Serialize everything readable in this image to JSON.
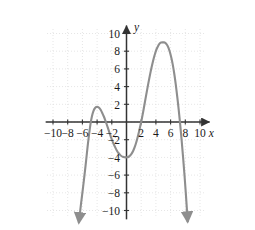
{
  "chart_data": {
    "type": "line",
    "title": "",
    "subtitle": "",
    "xlabel": "x",
    "ylabel": "y",
    "xlim": [
      -11.2,
      11.2
    ],
    "ylim": [
      -11.0,
      10.8
    ],
    "grid": true,
    "grid_style": "dotted",
    "grid_step": 2,
    "legend": "none",
    "axis_arrows": {
      "x_positive": true,
      "y_positive": true
    },
    "xticks": [
      -10,
      -8,
      -6,
      -4,
      -2,
      2,
      4,
      6,
      8,
      10
    ],
    "xtick_labels": [
      "−10",
      "−8",
      "−6",
      "−4",
      "−2",
      "2",
      "4",
      "6",
      "8",
      "10"
    ],
    "yticks": [
      10,
      8,
      6,
      4,
      2,
      -2,
      -4,
      -6,
      -8,
      -10
    ],
    "ytick_labels": [
      "10",
      "8",
      "6",
      "4",
      "2",
      "−2",
      "−4",
      "−6",
      "−8",
      "−10"
    ],
    "series": [
      {
        "name": "polynomial curve",
        "color": "#8e8e8e",
        "line_width": 2.1,
        "arrow_start": "down",
        "arrow_end": "down",
        "annotations": [
          {
            "label": "local maximum",
            "x": -4.0,
            "y": 1.7
          },
          {
            "label": "local minimum",
            "x": 0.2,
            "y": -4.0
          },
          {
            "label": "local maximum",
            "x": 5.2,
            "y": 9.0
          }
        ],
        "x_intercepts": [
          -5.2,
          -2.8,
          2.0,
          7.3
        ],
        "y_intercept": -4.0,
        "points": [
          [
            -6.35,
            -10.4
          ],
          [
            -6.2,
            -9.3
          ],
          [
            -6.0,
            -8.0
          ],
          [
            -5.8,
            -6.6
          ],
          [
            -5.6,
            -5.2
          ],
          [
            -5.4,
            -3.6
          ],
          [
            -5.2,
            -2.1
          ],
          [
            -5.0,
            -0.8
          ],
          [
            -4.8,
            0.3
          ],
          [
            -4.6,
            1.0
          ],
          [
            -4.4,
            1.45
          ],
          [
            -4.2,
            1.65
          ],
          [
            -4.0,
            1.72
          ],
          [
            -3.8,
            1.66
          ],
          [
            -3.6,
            1.5
          ],
          [
            -3.4,
            1.2
          ],
          [
            -3.2,
            0.85
          ],
          [
            -3.0,
            0.45
          ],
          [
            -2.8,
            0.0
          ],
          [
            -2.6,
            -0.5
          ],
          [
            -2.4,
            -1.0
          ],
          [
            -2.2,
            -1.5
          ],
          [
            -2.0,
            -1.95
          ],
          [
            -1.8,
            -2.4
          ],
          [
            -1.6,
            -2.75
          ],
          [
            -1.4,
            -3.1
          ],
          [
            -1.2,
            -3.4
          ],
          [
            -1.0,
            -3.6
          ],
          [
            -0.8,
            -3.78
          ],
          [
            -0.6,
            -3.9
          ],
          [
            -0.4,
            -3.97
          ],
          [
            -0.2,
            -4.0
          ],
          [
            0.0,
            -4.0
          ],
          [
            0.2,
            -3.97
          ],
          [
            0.4,
            -3.88
          ],
          [
            0.6,
            -3.7
          ],
          [
            0.8,
            -3.45
          ],
          [
            1.0,
            -3.1
          ],
          [
            1.2,
            -2.65
          ],
          [
            1.4,
            -2.1
          ],
          [
            1.6,
            -1.45
          ],
          [
            1.8,
            -0.75
          ],
          [
            2.0,
            0.0
          ],
          [
            2.2,
            0.85
          ],
          [
            2.4,
            1.75
          ],
          [
            2.6,
            2.7
          ],
          [
            2.8,
            3.6
          ],
          [
            3.0,
            4.5
          ],
          [
            3.2,
            5.35
          ],
          [
            3.4,
            6.15
          ],
          [
            3.6,
            6.85
          ],
          [
            3.8,
            7.5
          ],
          [
            4.0,
            8.05
          ],
          [
            4.2,
            8.45
          ],
          [
            4.4,
            8.75
          ],
          [
            4.6,
            8.95
          ],
          [
            4.8,
            9.0
          ],
          [
            5.0,
            9.0
          ],
          [
            5.2,
            9.0
          ],
          [
            5.4,
            8.85
          ],
          [
            5.6,
            8.6
          ],
          [
            5.8,
            8.2
          ],
          [
            6.0,
            7.6
          ],
          [
            6.2,
            6.9
          ],
          [
            6.4,
            6.0
          ],
          [
            6.6,
            4.9
          ],
          [
            6.8,
            3.6
          ],
          [
            7.0,
            2.2
          ],
          [
            7.2,
            0.6
          ],
          [
            7.4,
            -1.1
          ],
          [
            7.6,
            -3.0
          ],
          [
            7.8,
            -5.0
          ],
          [
            8.0,
            -7.2
          ],
          [
            8.15,
            -9.0
          ],
          [
            8.25,
            -10.3
          ]
        ]
      }
    ]
  },
  "style": {
    "axis_color": "#333333",
    "grid_color": "#dcdcdc",
    "curve_color": "#8e8e8e",
    "background": "#ffffff",
    "label_color": "#1a1a1a"
  }
}
